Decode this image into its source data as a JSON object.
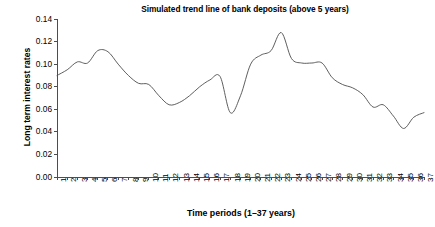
{
  "chart_data": {
    "type": "line",
    "title": "Simulated trend line of bank deposits (above 5 years)",
    "xlabel": "Time periods (1–37 years)",
    "ylabel": "Long term interest rates",
    "xlim": [
      1,
      37
    ],
    "ylim": [
      0.0,
      0.14
    ],
    "grid": false,
    "legend": "none",
    "line_color": "#4d4d4d",
    "y_ticks": [
      0.0,
      0.02,
      0.04,
      0.06,
      0.08,
      0.1,
      0.12,
      0.14
    ],
    "y_tick_labels": [
      "0.00",
      "0.02",
      "0.04",
      "0.06",
      "0.08",
      "0.10",
      "0.12",
      "0.14"
    ],
    "x_ticks": [
      1,
      2,
      3,
      4,
      5,
      6,
      7,
      8,
      9,
      10,
      11,
      12,
      13,
      14,
      15,
      16,
      17,
      18,
      19,
      20,
      21,
      22,
      23,
      24,
      25,
      26,
      27,
      28,
      29,
      30,
      31,
      32,
      33,
      34,
      35,
      36,
      37
    ],
    "x_tick_labels": [
      "1",
      "2",
      "3",
      "4",
      "5",
      "6",
      "7",
      "8",
      "9",
      "10",
      "11",
      "12",
      "13",
      "14",
      "15",
      "16",
      "17",
      "18",
      "19",
      "20",
      "21",
      "22",
      "23",
      "24",
      "25",
      "26",
      "27",
      "28",
      "29",
      "30",
      "31",
      "32",
      "33",
      "34",
      "35",
      "36",
      "37"
    ],
    "series": [
      {
        "name": "Simulated long term interest rate",
        "x": [
          1,
          2,
          3,
          4,
          5,
          6,
          7,
          8,
          9,
          10,
          11,
          12,
          13,
          14,
          15,
          16,
          17,
          18,
          19,
          20,
          21,
          22,
          23,
          24,
          25,
          26,
          27,
          28,
          29,
          30,
          31,
          32,
          33,
          34,
          35,
          36,
          37
        ],
        "values": [
          0.09,
          0.095,
          0.102,
          0.101,
          0.112,
          0.111,
          0.1,
          0.09,
          0.083,
          0.082,
          0.072,
          0.064,
          0.066,
          0.072,
          0.08,
          0.086,
          0.089,
          0.057,
          0.072,
          0.1,
          0.108,
          0.112,
          0.128,
          0.105,
          0.101,
          0.101,
          0.101,
          0.088,
          0.082,
          0.079,
          0.073,
          0.062,
          0.064,
          0.054,
          0.043,
          0.053,
          0.057
        ]
      }
    ]
  },
  "plot_geometry": {
    "left": 57,
    "right": 424,
    "top": 19,
    "bottom": 177
  }
}
